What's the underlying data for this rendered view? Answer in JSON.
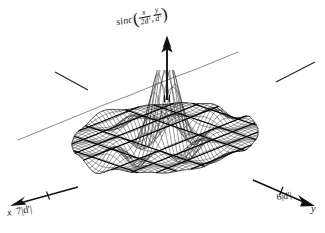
{
  "figure": {
    "title_formula": "sinc(x/2d', y/d')",
    "style": "hand-drawn scanned line drawing, black ink on white paper"
  },
  "z_axis": {
    "name": "z-axis",
    "function_name": "sinc",
    "open_paren": "(",
    "arg1_num": "x",
    "arg1_den": "2d'",
    "separator": ",",
    "arg2_num": "y",
    "arg2_den": "d'",
    "close_paren": ")",
    "arrow": "up-arrow"
  },
  "x_axis": {
    "name": "x-axis",
    "label": "x",
    "tick_value": "7|d'|",
    "arrow": "down-left-arrow"
  },
  "y_axis": {
    "name": "y-axis",
    "label": "y",
    "tick_value": "6|d'|",
    "arrow": "down-right-arrow"
  },
  "annotations": {
    "left_leader_line": "leader line pointing up-left from surface edge",
    "right_leader_line": "leader line pointing up-right from surface edge"
  },
  "colors": {
    "ink": "#111111",
    "mesh": "#2a2a2a",
    "contour": "#000000",
    "background": "#ffffff"
  },
  "chart_data": {
    "type": "surface",
    "xlabel": "x",
    "ylabel": "y",
    "zlabel": "sinc(x/2d', y/d')",
    "function": "sinc(x/(2d')) * sinc(y/d')",
    "x_tick_labels": [
      "7|d'|"
    ],
    "y_tick_labels": [
      "6|d'|"
    ],
    "domain_shape": "ellipse",
    "xlim": [
      -7,
      7
    ],
    "ylim": [
      -6,
      6
    ],
    "zlim": [
      -0.25,
      1.0
    ],
    "peak_value": 1.0,
    "peak_location": [
      0,
      0
    ],
    "grid": true,
    "legend": false,
    "mesh_lines_u": 40,
    "mesh_lines_v": 36,
    "zero_contours": true,
    "projection": "oblique 3d wireframe"
  }
}
